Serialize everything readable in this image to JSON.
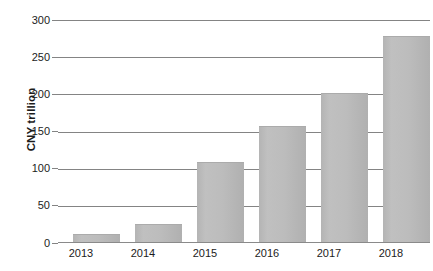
{
  "chart_data": {
    "type": "bar",
    "title": "",
    "subtitle": "",
    "xlabel": "",
    "ylabel": "CNY trillion",
    "categories": [
      "2013",
      "2014",
      "2015",
      "2016",
      "2017",
      "2018"
    ],
    "values": [
      11,
      24,
      108,
      157,
      201,
      279
    ],
    "series": [
      {
        "name": "CNY trillion",
        "values": [
          11,
          24,
          108,
          157,
          201,
          279
        ]
      }
    ],
    "ylim": [
      0,
      300
    ],
    "yticks": [
      0,
      50,
      100,
      150,
      200,
      250,
      300
    ],
    "ytick_labels": [
      "0",
      "50",
      "100",
      "150",
      "200",
      "250",
      "300"
    ],
    "grid": true,
    "grid_axis": "y",
    "legend": false,
    "legend_position": "none",
    "annotations": [],
    "colors": {
      "bar_fill": "#bcbcbc",
      "bar_edge": "#ababab",
      "gridline": "#848484",
      "axis_text": "#1c1c1c",
      "background": "#ffffff"
    }
  }
}
